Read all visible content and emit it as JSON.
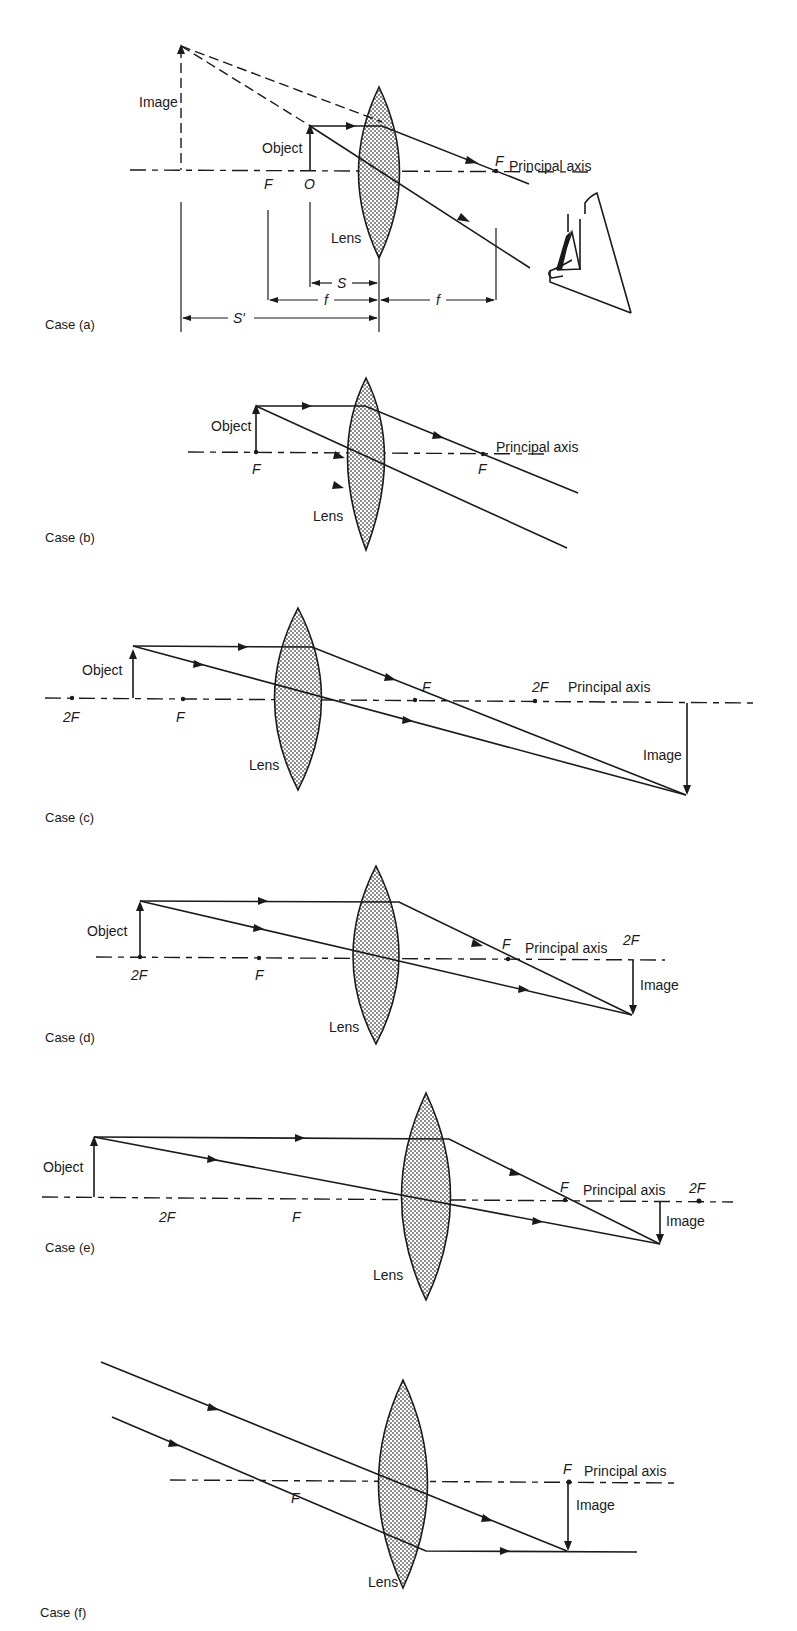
{
  "figure": {
    "common_labels": {
      "lens": "Lens",
      "principal_axis": "Principal axis",
      "object": "Object",
      "image": "Image",
      "focus": "F",
      "twice_focus": "2F"
    },
    "cases": [
      {
        "id": "a",
        "label": "Case (a)",
        "object_position": "between F and lens",
        "image_type": "virtual, upright, magnified",
        "labels": {
          "image": "Image",
          "object": "Object",
          "focus_left": "F",
          "origin": "O",
          "focus_right": "F",
          "principal_axis": "Principal axis",
          "lens": "Lens",
          "dim_s": "S",
          "dim_f_left": "f",
          "dim_f_right": "f",
          "dim_s_prime": "S′"
        },
        "has_eye": true
      },
      {
        "id": "b",
        "label": "Case (b)",
        "object_position": "at F",
        "image_type": "at infinity (parallel rays)",
        "labels": {
          "object": "Object",
          "focus_left": "F",
          "focus_right": "F",
          "principal_axis": "Principal axis",
          "lens": "Lens"
        }
      },
      {
        "id": "c",
        "label": "Case (c)",
        "object_position": "between F and 2F",
        "image_type": "real, inverted, magnified, beyond 2F",
        "labels": {
          "object": "Object",
          "twoF_left": "2F",
          "focus_left": "F",
          "focus_right": "F",
          "twoF_right": "2F",
          "principal_axis": "Principal axis",
          "image": "Image",
          "lens": "Lens"
        }
      },
      {
        "id": "d",
        "label": "Case (d)",
        "object_position": "at 2F",
        "image_type": "real, inverted, same size, at 2F",
        "labels": {
          "object": "Object",
          "twoF_left": "2F",
          "focus_left": "F",
          "focus_right": "F",
          "principal_axis": "Principal axis",
          "twoF_right": "2F",
          "image": "Image",
          "lens": "Lens"
        }
      },
      {
        "id": "e",
        "label": "Case (e)",
        "object_position": "beyond 2F",
        "image_type": "real, inverted, diminished, between F and 2F",
        "labels": {
          "object": "Object",
          "twoF_left": "2F",
          "focus_left": "F",
          "focus_right": "F",
          "principal_axis": "Principal axis",
          "twoF_right": "2F",
          "image": "Image",
          "lens": "Lens"
        }
      },
      {
        "id": "f",
        "label": "Case (f)",
        "object_position": "at infinity",
        "image_type": "real, inverted, point-sized, at F",
        "labels": {
          "focus_left": "F",
          "focus_right": "F",
          "principal_axis": "Principal axis",
          "image": "Image",
          "lens": "Lens"
        }
      }
    ]
  },
  "colors": {
    "ink": "#1a1a1a",
    "background": "#ffffff",
    "lens_fill": "#d9d9d9"
  }
}
